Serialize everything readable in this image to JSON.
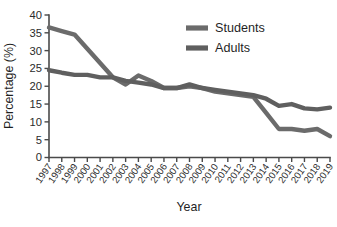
{
  "chart_data": {
    "type": "line",
    "title": "",
    "xlabel": "Year",
    "ylabel": "Percentage (%)",
    "categories": [
      "1997",
      "1998",
      "1999",
      "2000",
      "2001",
      "2002",
      "2003",
      "2004",
      "2005",
      "2006",
      "2007",
      "2008",
      "2009",
      "2010",
      "2011",
      "2012",
      "2013",
      "2014",
      "2015",
      "2016",
      "2017",
      "2018",
      "2019"
    ],
    "x": [
      1997,
      1998,
      1999,
      2000,
      2001,
      2002,
      2003,
      2004,
      2005,
      2006,
      2007,
      2008,
      2009,
      2010,
      2011,
      2012,
      2013,
      2014,
      2015,
      2016,
      2017,
      2018,
      2019
    ],
    "series": [
      {
        "name": "Students",
        "color": "#6b6b6b",
        "values": [
          36.5,
          35.5,
          34.5,
          30.5,
          26.5,
          22.5,
          20.5,
          23.0,
          21.5,
          19.5,
          19.5,
          20.0,
          19.5,
          18.5,
          18.0,
          17.5,
          17.0,
          12.5,
          8.0,
          8.0,
          7.5,
          8.0,
          6.0
        ]
      },
      {
        "name": "Adults",
        "color": "#5f5f5f",
        "values": [
          24.5,
          23.8,
          23.2,
          23.2,
          22.5,
          22.5,
          21.5,
          21.0,
          20.5,
          19.5,
          19.5,
          20.5,
          19.5,
          19.0,
          18.5,
          18.0,
          17.5,
          16.5,
          14.5,
          15.0,
          13.8,
          13.5,
          14.0
        ]
      }
    ],
    "yticks": [
      0,
      5,
      10,
      15,
      20,
      25,
      30,
      35,
      40
    ],
    "ylim": [
      0,
      40
    ],
    "xlim": [
      1997,
      2019
    ],
    "grid": false,
    "legend_position": "top-right",
    "legend_entries": [
      "Students",
      "Adults"
    ]
  },
  "legend": {
    "items": [
      {
        "label": "Students",
        "color": "#6b6b6b"
      },
      {
        "label": "Adults",
        "color": "#5f5f5f"
      }
    ]
  },
  "axes": {
    "y_title": "Percentage (%)",
    "x_title": "Year"
  }
}
